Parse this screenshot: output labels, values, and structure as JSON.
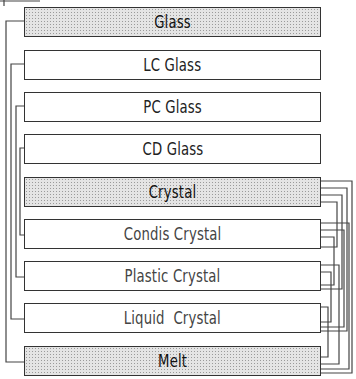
{
  "diagram": {
    "phases": [
      {
        "id": "glass",
        "label": "Glass",
        "shaded": true,
        "top": 7
      },
      {
        "id": "lc-glass",
        "label": "LC Glass",
        "shaded": false,
        "top": 50
      },
      {
        "id": "pc-glass",
        "label": "PC Glass",
        "shaded": false,
        "top": 92
      },
      {
        "id": "cd-glass",
        "label": "CD Glass",
        "shaded": false,
        "top": 134
      },
      {
        "id": "crystal",
        "label": "Crystal",
        "shaded": true,
        "top": 177
      },
      {
        "id": "condis-crystal",
        "label": "Condis Crystal",
        "shaded": false,
        "top": 219
      },
      {
        "id": "plastic-crystal",
        "label": "Plastic Crystal",
        "shaded": false,
        "top": 261
      },
      {
        "id": "liquid-crystal",
        "label": "Liquid  Crystal",
        "shaded": false,
        "top": 303
      },
      {
        "id": "melt",
        "label": "Melt",
        "shaded": true,
        "top": 346
      }
    ],
    "left_connections": [
      [
        "Glass",
        "Melt"
      ],
      [
        "LC Glass",
        "Liquid Crystal"
      ],
      [
        "PC Glass",
        "Plastic Crystal"
      ],
      [
        "CD Glass",
        "Condis Crystal"
      ]
    ],
    "right_connections": [
      [
        "Crystal",
        "Condis Crystal"
      ],
      [
        "Crystal",
        "Plastic Crystal"
      ],
      [
        "Crystal",
        "Liquid Crystal"
      ],
      [
        "Crystal",
        "Melt"
      ],
      [
        "Condis Crystal",
        "Plastic Crystal"
      ],
      [
        "Condis Crystal",
        "Liquid Crystal"
      ],
      [
        "Condis Crystal",
        "Melt"
      ],
      [
        "Plastic Crystal",
        "Liquid Crystal"
      ],
      [
        "Plastic Crystal",
        "Melt"
      ],
      [
        "Liquid Crystal",
        "Melt"
      ]
    ],
    "colors": {
      "line": "#444444",
      "shade": "#e4e4e4",
      "text": "#222222"
    }
  }
}
